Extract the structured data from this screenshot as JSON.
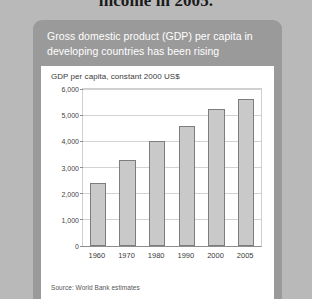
{
  "page": {
    "heading_fragment": "income in 2005."
  },
  "card": {
    "title": "Gross domestic product (GDP) per capita in developing countries has been rising",
    "source": "Source: World Bank estimates"
  },
  "chart_data": {
    "type": "bar",
    "title": "GDP per capita, constant 2000 US$",
    "xlabel": "",
    "ylabel": "",
    "categories": [
      "1960",
      "1970",
      "1980",
      "1990",
      "2000",
      "2005"
    ],
    "values": [
      2400,
      3300,
      4000,
      4600,
      5250,
      5600
    ],
    "ylim": [
      0,
      6000
    ],
    "ytick_labels": [
      "0",
      "1,000",
      "2,000",
      "3,000",
      "4,000",
      "5,000",
      "6,000"
    ],
    "ytick_values": [
      0,
      1000,
      2000,
      3000,
      4000,
      5000,
      6000
    ],
    "grid": true,
    "legend": "none",
    "bar_color": "#c9c9c9",
    "bar_border_color": "#7d7d7d"
  },
  "colors": {
    "page_background": "#b9b9b9",
    "card_background": "#9a9a9a",
    "panel_background": "#ffffff",
    "title_text": "#ffffff"
  }
}
